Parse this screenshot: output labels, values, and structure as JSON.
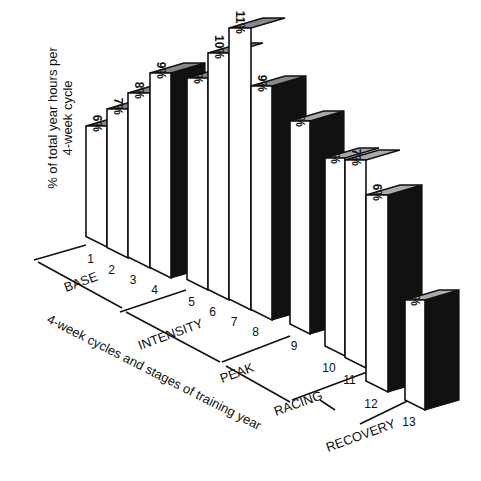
{
  "chart_data": {
    "type": "bar",
    "title": "",
    "ylabel": "% of total year hours per 4-week cycle",
    "ylabel_lines": [
      "% of total year hours per",
      "4-week cycle"
    ],
    "xlabel": "4-week cycles and stages of training year",
    "categories": [
      "1",
      "2",
      "3",
      "4",
      "5",
      "6",
      "7",
      "8",
      "9",
      "10",
      "11",
      "12",
      "13"
    ],
    "values": [
      6,
      7,
      8,
      9,
      9,
      10,
      11,
      9,
      8,
      7,
      7,
      6,
      3
    ],
    "value_labels": [
      "6%",
      "7%",
      "8%",
      "9%",
      "9%",
      "10%",
      "11%",
      "9%",
      "8%",
      "7%",
      "7%",
      "6%",
      "3%"
    ],
    "unit": "%",
    "stages": [
      {
        "name": "BASE",
        "cycles": [
          "1",
          "2",
          "3",
          "4"
        ]
      },
      {
        "name": "INTENSITY",
        "cycles": [
          "5",
          "6",
          "7",
          "8"
        ]
      },
      {
        "name": "PEAK",
        "cycles": [
          "9"
        ]
      },
      {
        "name": "RACING",
        "cycles": [
          "10",
          "11",
          "12"
        ]
      },
      {
        "name": "RECOVERY",
        "cycles": [
          "13"
        ]
      }
    ],
    "style": "3d-oblique-bars",
    "grid": false,
    "legend": null
  },
  "colors": {
    "bar_front": "#ffffff",
    "bar_side": "#111111",
    "bar_top": "#aaaaaa",
    "line": "#111111",
    "background": "#ffffff"
  },
  "geometry": {
    "bars": [
      {
        "x": 86,
        "w": 21,
        "top": 126,
        "bot": 247
      },
      {
        "x": 107,
        "w": 21,
        "top": 109,
        "bot": 258
      },
      {
        "x": 128,
        "w": 22,
        "top": 93,
        "bot": 268
      },
      {
        "x": 150,
        "w": 21,
        "top": 73,
        "bot": 278
      },
      {
        "x": 187,
        "w": 21,
        "top": 78,
        "bot": 290
      },
      {
        "x": 208,
        "w": 21,
        "top": 53,
        "bot": 300
      },
      {
        "x": 229,
        "w": 22,
        "top": 28,
        "bot": 310
      },
      {
        "x": 251,
        "w": 21,
        "top": 86,
        "bot": 320
      },
      {
        "x": 290,
        "w": 20,
        "top": 121,
        "bot": 334
      },
      {
        "x": 325,
        "w": 20,
        "top": 158,
        "bot": 356
      },
      {
        "x": 345,
        "w": 21,
        "top": 160,
        "bot": 368
      },
      {
        "x": 366,
        "w": 22,
        "top": 195,
        "bot": 392
      },
      {
        "x": 405,
        "w": 20,
        "top": 300,
        "bot": 410
      }
    ],
    "depth": {
      "dx": 34,
      "dy": -10
    },
    "block_ends": [
      3,
      7,
      8,
      11,
      12
    ]
  }
}
